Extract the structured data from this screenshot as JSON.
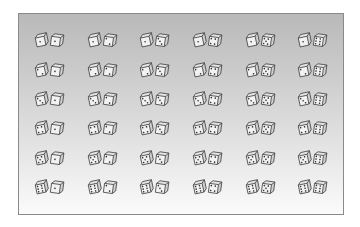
{
  "panel": {
    "background_top": "#b9b9b9",
    "background_bottom": "#fbfbfb",
    "border_color": "#8a8a8a"
  },
  "dice_grid": {
    "rows": 6,
    "columns": 6,
    "item": "pair-of-dice",
    "pairs": [
      [
        {
          "left": 1,
          "right": 1
        },
        {
          "left": 1,
          "right": 2
        },
        {
          "left": 1,
          "right": 3
        },
        {
          "left": 1,
          "right": 4
        },
        {
          "left": 1,
          "right": 5
        },
        {
          "left": 1,
          "right": 6
        }
      ],
      [
        {
          "left": 2,
          "right": 1
        },
        {
          "left": 2,
          "right": 2
        },
        {
          "left": 2,
          "right": 3
        },
        {
          "left": 2,
          "right": 4
        },
        {
          "left": 2,
          "right": 5
        },
        {
          "left": 2,
          "right": 6
        }
      ],
      [
        {
          "left": 3,
          "right": 1
        },
        {
          "left": 3,
          "right": 2
        },
        {
          "left": 3,
          "right": 3
        },
        {
          "left": 3,
          "right": 4
        },
        {
          "left": 3,
          "right": 5
        },
        {
          "left": 3,
          "right": 6
        }
      ],
      [
        {
          "left": 4,
          "right": 1
        },
        {
          "left": 4,
          "right": 2
        },
        {
          "left": 4,
          "right": 3
        },
        {
          "left": 4,
          "right": 4
        },
        {
          "left": 4,
          "right": 5
        },
        {
          "left": 4,
          "right": 6
        }
      ],
      [
        {
          "left": 5,
          "right": 1
        },
        {
          "left": 5,
          "right": 2
        },
        {
          "left": 5,
          "right": 3
        },
        {
          "left": 5,
          "right": 4
        },
        {
          "left": 5,
          "right": 5
        },
        {
          "left": 5,
          "right": 6
        }
      ],
      [
        {
          "left": 6,
          "right": 1
        },
        {
          "left": 6,
          "right": 2
        },
        {
          "left": 6,
          "right": 3
        },
        {
          "left": 6,
          "right": 4
        },
        {
          "left": 6,
          "right": 5
        },
        {
          "left": 6,
          "right": 6
        }
      ]
    ]
  }
}
